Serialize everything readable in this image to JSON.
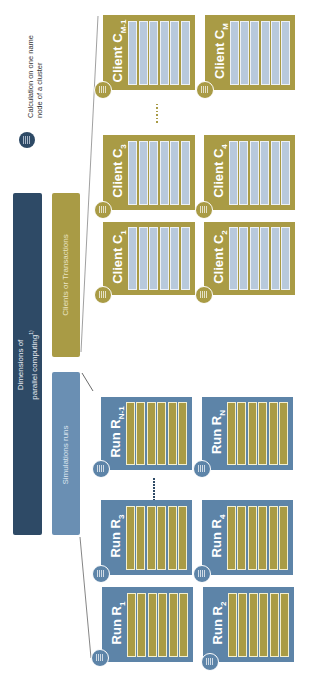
{
  "legend": {
    "icon": "server-node-icon",
    "text": "Calculation on one name node of a cluster",
    "line1": "Calculation on one name",
    "line2": "node of a cluster"
  },
  "header": {
    "title_line1": "Dimensions of",
    "title_line2": "parallel computing",
    "title_sup": "1)",
    "clients_label": "Clients or Transactions",
    "simulations_label": "Simulations runs"
  },
  "clients": [
    {
      "id": "C1",
      "label": "Client C",
      "sub": "1",
      "slots": [
        "Run R1",
        "Run R2",
        "Run R3",
        "Run R4",
        "Run ...",
        "Run RN"
      ]
    },
    {
      "id": "C2",
      "label": "Client C",
      "sub": "2",
      "slots": [
        "Run R1",
        "Run R2",
        "Run R3",
        "Run R4",
        "Run ...",
        "Run RN"
      ]
    },
    {
      "id": "C3",
      "label": "Client C",
      "sub": "3",
      "slots": [
        "Run R1",
        "Run R2",
        "Run R3",
        "Run R4",
        "Run ...",
        "Run RN"
      ]
    },
    {
      "id": "C4",
      "label": "Client C",
      "sub": "4",
      "slots": [
        "Run R1",
        "Run R2",
        "Run R3",
        "Run R4",
        "Run ...",
        "Run RN"
      ]
    },
    {
      "id": "CM-1",
      "label": "Client C",
      "sub": "M-1",
      "slots": [
        "Run R1",
        "Run R2",
        "Run R3",
        "Run R4",
        "Run ...",
        "Run RN"
      ]
    },
    {
      "id": "CM",
      "label": "Client C",
      "sub": "M",
      "slots": [
        "Run R1",
        "Run R2",
        "Run R3",
        "Run R4",
        "Run ...",
        "Run RN"
      ]
    }
  ],
  "runs": [
    {
      "id": "R1",
      "label": "Run R",
      "sub": "1",
      "slots": [
        "Client C1 Loads Runs",
        "Client C2 Loads Runs",
        "Client C3 Loads Runs",
        "Client C4 Loads Runs",
        "Client ...",
        "Client CM Loads Runs"
      ]
    },
    {
      "id": "R2",
      "label": "Run R",
      "sub": "2",
      "slots": [
        "Client C1 Loads Runs",
        "Client C2 Loads Runs",
        "Client C3 Loads Runs",
        "Client C4 Loads Runs",
        "Client ...",
        "Client CM Loads Runs"
      ]
    },
    {
      "id": "R3",
      "label": "Run R",
      "sub": "3",
      "slots": [
        "Client C1 Loads Runs",
        "Client C2 Loads Runs",
        "Client C3 Loads Runs",
        "Client C4 Loads Runs",
        "Client ...",
        "Client CM Loads Runs"
      ]
    },
    {
      "id": "R4",
      "label": "Run R",
      "sub": "4",
      "slots": [
        "Client C1 Loads Runs",
        "Client C2 Loads Runs",
        "Client C3 Loads Runs",
        "Client C4 Loads Runs",
        "Client ...",
        "Client CM Loads Runs"
      ]
    },
    {
      "id": "RN-1",
      "label": "Run R",
      "sub": "N-1",
      "slots": [
        "Client C1 Loads Runs",
        "Client C2 Loads Runs",
        "Client C3 Loads Runs",
        "Client C4 Loads Runs",
        "Client ...",
        "Client CM Loads Runs"
      ]
    },
    {
      "id": "RN",
      "label": "Run R",
      "sub": "N",
      "slots": [
        "Client C1 Loads Runs",
        "Client C2 Loads Runs",
        "Client C3 Loads Runs",
        "Client C4 Loads Runs",
        "Client ...",
        "Client CM Loads Runs"
      ]
    }
  ],
  "colors": {
    "navy": "#2e4a66",
    "gold": "#a99b45",
    "run_blue": "#5d84a8",
    "sim_blue": "#6a8fb3",
    "client_slot": "#b8c9dc"
  }
}
